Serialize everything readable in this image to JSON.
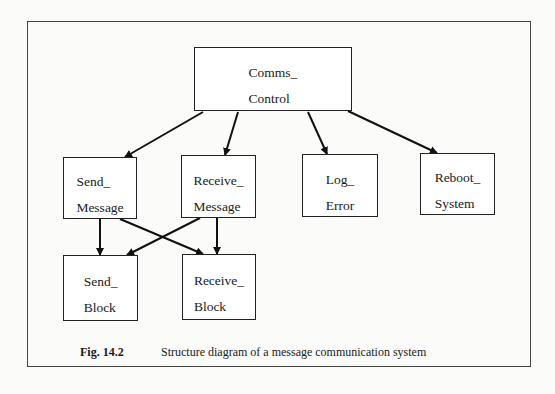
{
  "figure": {
    "caption_number": "Fig. 14.2",
    "caption_text": "Structure diagram of a message communication system"
  },
  "nodes": [
    {
      "id": "comms_control",
      "line1": "Comms_",
      "line2": "Control"
    },
    {
      "id": "send_message",
      "line1": "Send_",
      "line2": "Message"
    },
    {
      "id": "receive_message",
      "line1": "Receive_",
      "line2": "Message"
    },
    {
      "id": "log_error",
      "line1": "Log_",
      "line2": "Error"
    },
    {
      "id": "reboot_system",
      "line1": "Reboot_",
      "line2": "System"
    },
    {
      "id": "send_block",
      "line1": "Send_",
      "line2": "Block"
    },
    {
      "id": "receive_block",
      "line1": "Receive_",
      "line2": "Block"
    }
  ],
  "edges": [
    {
      "from": "Comms_Control",
      "to": "Send_Message"
    },
    {
      "from": "Comms_Control",
      "to": "Receive_Message"
    },
    {
      "from": "Comms_Control",
      "to": "Log_Error"
    },
    {
      "from": "Comms_Control",
      "to": "Reboot_System"
    },
    {
      "from": "Send_Message",
      "to": "Send_Block"
    },
    {
      "from": "Send_Message",
      "to": "Receive_Block"
    },
    {
      "from": "Receive_Message",
      "to": "Send_Block"
    },
    {
      "from": "Receive_Message",
      "to": "Receive_Block"
    }
  ]
}
